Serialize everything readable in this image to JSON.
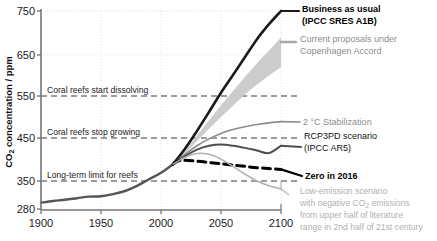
{
  "chart_data": {
    "type": "line",
    "title": "",
    "xlabel": "",
    "ylabel": "CO₂ concentration / ppm",
    "xlim": [
      1900,
      2100
    ],
    "ylim": [
      280,
      750
    ],
    "xticks": [
      1900,
      1950,
      2000,
      2050,
      2100
    ],
    "yticks": [
      280,
      350,
      450,
      550,
      650,
      750
    ],
    "grid": "dotted-light",
    "legend_position": "right-inline-annotations",
    "threshold_lines": [
      {
        "name": "coral-reefs-start-dissolving",
        "label": "Coral reefs start dissolving",
        "value": 550,
        "style": "dashed"
      },
      {
        "name": "coral-reefs-stop-growing",
        "label": "Coral reefs stop growing",
        "value": 450,
        "style": "dashed"
      },
      {
        "name": "long-term-limit-for-reefs",
        "label": "Long-term limit for reefs",
        "value": 350,
        "style": "dashed"
      }
    ],
    "historical": {
      "name": "historical-observed",
      "x": [
        1900,
        1910,
        1920,
        1930,
        1940,
        1950,
        1960,
        1970,
        1980,
        1990,
        2000,
        2010
      ],
      "values": [
        296,
        300,
        303,
        307,
        311,
        312,
        317,
        325,
        338,
        354,
        369,
        389
      ],
      "color": "#555555"
    },
    "series": [
      {
        "name": "business-as-usual",
        "label": "Business as usual",
        "sublabel": "(IPCC SRES A1B)",
        "color": "#1a1a1a",
        "style": "solid",
        "width": 2.6,
        "x": [
          2010,
          2020,
          2030,
          2040,
          2050,
          2060,
          2070,
          2080,
          2090,
          2100
        ],
        "values": [
          389,
          425,
          467,
          512,
          558,
          601,
          645,
          686,
          720,
          750
        ],
        "endpoint": 750
      },
      {
        "name": "copenhagen-accord-band",
        "label": "Current proposals under",
        "sublabel": "Copenhagen Accord",
        "color": "#c9c9c9",
        "style": "band",
        "x": [
          2010,
          2020,
          2030,
          2040,
          2050,
          2060,
          2070,
          2080,
          2090,
          2100
        ],
        "upper": [
          389,
          420,
          456,
          492,
          528,
          562,
          597,
          630,
          660,
          690
        ],
        "lower": [
          389,
          414,
          443,
          472,
          500,
          527,
          554,
          578,
          600,
          620
        ],
        "endpoint_upper": 690,
        "endpoint_lower": 620
      },
      {
        "name": "two-degree-stabilization",
        "label": "2 °C Stabilization",
        "sublabel": "",
        "color": "#8c8c8c",
        "style": "solid",
        "width": 1.6,
        "x": [
          2010,
          2020,
          2030,
          2040,
          2050,
          2060,
          2070,
          2080,
          2090,
          2100
        ],
        "values": [
          389,
          412,
          432,
          448,
          461,
          470,
          477,
          482,
          486,
          489
        ],
        "endpoint": 489
      },
      {
        "name": "rcp3pd-scenario",
        "label": "RCP3PD scenario",
        "sublabel": "(IPCC AR5)",
        "color": "#4f4f4f",
        "style": "solid",
        "width": 2.0,
        "x": [
          2010,
          2020,
          2030,
          2040,
          2050,
          2060,
          2070,
          2080,
          2090,
          2100
        ],
        "values": [
          389,
          408,
          423,
          432,
          435,
          432,
          427,
          421,
          415,
          432
        ],
        "endpoint": 432
      },
      {
        "name": "zero-in-2016",
        "label": "Zero in 2016",
        "sublabel": "",
        "color": "#000000",
        "style": "dashed-thick",
        "width": 3.0,
        "x": [
          2010,
          2016,
          2030,
          2040,
          2050,
          2060,
          2070,
          2080,
          2090,
          2100
        ],
        "values": [
          389,
          398,
          396,
          393,
          390,
          387,
          384,
          381,
          379,
          377
        ],
        "endpoint": 377
      },
      {
        "name": "low-emission-negative-co2",
        "label": "Low-emission scenario",
        "sublabel": "with negative CO₂ emissions from upper half of literature range in 2nd half of 21st century",
        "color": "#b0b0b0",
        "style": "solid",
        "width": 1.5,
        "x": [
          2010,
          2020,
          2030,
          2040,
          2050,
          2060,
          2070,
          2080,
          2090,
          2100
        ],
        "values": [
          389,
          405,
          414,
          412,
          401,
          384,
          366,
          350,
          338,
          330
        ],
        "endpoint": 330
      }
    ]
  },
  "axis": {
    "y_title": "CO₂ concentration / ppm",
    "y_title_pre": "CO",
    "y_title_sub": "2",
    "y_title_post": " concentration / ppm",
    "yticks": [
      "750",
      "650",
      "550",
      "450",
      "350",
      "280"
    ],
    "xticks": [
      "1900",
      "1950",
      "2000",
      "2050",
      "2100"
    ]
  },
  "annotations": {
    "coral_start": "Coral reefs start dissolving",
    "coral_stop": "Coral reefs stop growing",
    "long_term": "Long-term limit for reefs"
  },
  "labels": {
    "bau_line1": "Business as usual",
    "bau_line2": "(IPCC SRES A1B)",
    "copenhagen_line1": "Current proposals under",
    "copenhagen_line2": "Copenhagen Accord",
    "two_c": "2 °C Stabilization",
    "rcp_line1": "RCP3PD scenario",
    "rcp_line2": "(IPCC AR5)",
    "zero": "Zero in 2016",
    "low_line1": "Low-emission scenario",
    "low_line2_pre": "with negative CO",
    "low_line2_sub": "2",
    "low_line2_post": " emissions",
    "low_line3": "from upper half of literature",
    "low_line4": "range in 2nd half of 21st century"
  },
  "colors": {
    "bau": "#1a1a1a",
    "band": "#c9c9c9",
    "two_c": "#8c8c8c",
    "rcp": "#4f4f4f",
    "zero": "#000000",
    "low": "#b0b0b0",
    "historical": "#555555",
    "axis": "#777777",
    "grid": "#d8d8d8"
  }
}
